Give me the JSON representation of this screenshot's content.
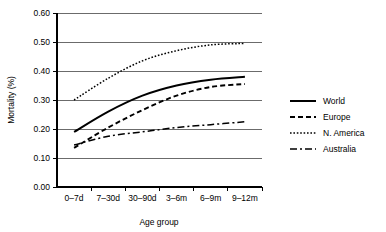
{
  "chart_data": {
    "type": "line",
    "title": "",
    "xlabel": "Age group",
    "ylabel": "Mortality (%)",
    "categories": [
      "0–7d",
      "7–30d",
      "30–90d",
      "3–6m",
      "6–9m",
      "9–12m"
    ],
    "ylim": [
      0.0,
      0.6
    ],
    "ytick_labels": [
      "0.00",
      "0.10",
      "0.20",
      "0.30",
      "0.40",
      "0.50",
      "0.60"
    ],
    "ytick_values": [
      0.0,
      0.1,
      0.2,
      0.3,
      0.4,
      0.5,
      0.6
    ],
    "grid": true,
    "legend_position": "right",
    "series": [
      {
        "name": "World",
        "style": "solid",
        "dash": "none",
        "width": 2.0,
        "values": [
          0.19,
          0.26,
          0.315,
          0.35,
          0.37,
          0.38
        ]
      },
      {
        "name": "Europe",
        "style": "dashed",
        "dash": "5,3",
        "width": 1.9,
        "values": [
          0.135,
          0.205,
          0.265,
          0.315,
          0.345,
          0.355
        ]
      },
      {
        "name": "N. America",
        "style": "dotted",
        "dash": "1.6,1.8",
        "width": 1.5,
        "values": [
          0.3,
          0.375,
          0.435,
          0.47,
          0.49,
          0.495
        ]
      },
      {
        "name": "Australia",
        "style": "dash-dot",
        "dash": "7,3,2,3",
        "width": 1.5,
        "values": [
          0.145,
          0.175,
          0.19,
          0.205,
          0.215,
          0.225
        ]
      }
    ]
  },
  "legend": {
    "items": [
      {
        "label": "World"
      },
      {
        "label": "Europe"
      },
      {
        "label": "N. America"
      },
      {
        "label": "Australia"
      }
    ]
  },
  "colors": {
    "line": "#000000",
    "grid": "#6b6b6b",
    "background": "#ffffff"
  }
}
